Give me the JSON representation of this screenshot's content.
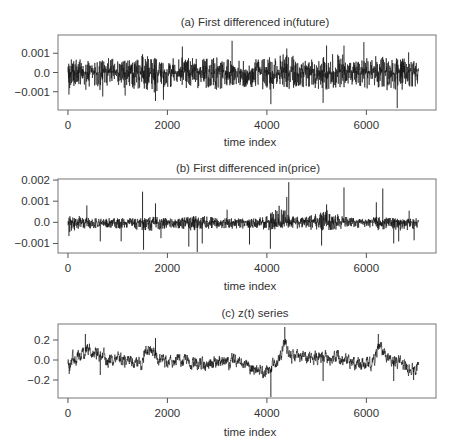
{
  "chart_data": [
    {
      "type": "line",
      "title": "(a) First differenced in(future)",
      "xlabel": "time index",
      "ylabel": "",
      "xlim": [
        -200,
        7400
      ],
      "ylim": [
        -0.00195,
        0.00195
      ],
      "xticks": [
        0,
        2000,
        4000,
        6000
      ],
      "xtick_labels": [
        "0",
        "2000",
        "4000",
        "6000"
      ],
      "yticks": [
        0.001,
        0.0,
        -0.001
      ],
      "ytick_labels": [
        "0.001",
        "0.0",
        "−0.001"
      ],
      "n_points": 7050,
      "grid": false,
      "legend": "none",
      "series": [
        {
          "name": "first-differenced ln(future)",
          "color": "#111111",
          "envelope_step": 250,
          "envelope_x": [
            0,
            250,
            500,
            750,
            1000,
            1250,
            1500,
            1750,
            2000,
            2250,
            2500,
            2750,
            3000,
            3250,
            3500,
            3750,
            4000,
            4250,
            4500,
            4750,
            5000,
            5250,
            5500,
            5750,
            6000,
            6250,
            6500,
            6750,
            7000
          ],
          "upper": [
            0.0007,
            0.0008,
            0.0006,
            0.0009,
            0.0006,
            0.0007,
            0.0009,
            0.0008,
            0.0007,
            0.0008,
            0.0009,
            0.0007,
            0.0008,
            0.0007,
            0.0006,
            0.0007,
            0.0008,
            0.001,
            0.0009,
            0.0006,
            0.0008,
            0.0011,
            0.001,
            0.0006,
            0.0008,
            0.0009,
            0.0008,
            0.0008,
            0.0007
          ],
          "lower": [
            -0.0009,
            -0.0007,
            -0.0008,
            -0.001,
            -0.0007,
            -0.0009,
            -0.0008,
            -0.0011,
            -0.0008,
            -0.0007,
            -0.0009,
            -0.0008,
            -0.0009,
            -0.0007,
            -0.0008,
            -0.0008,
            -0.001,
            -0.0008,
            -0.0009,
            -0.0008,
            -0.0009,
            -0.0009,
            -0.0008,
            -0.0007,
            -0.0009,
            -0.0008,
            -0.001,
            -0.0009,
            -0.0008
          ],
          "spikes": [
            {
              "x": 20,
              "y": -0.00115
            },
            {
              "x": 360,
              "y": -0.0009
            },
            {
              "x": 700,
              "y": -0.00125
            },
            {
              "x": 1150,
              "y": -0.0012
            },
            {
              "x": 1500,
              "y": 0.00095
            },
            {
              "x": 1760,
              "y": -0.00148
            },
            {
              "x": 1920,
              "y": -0.00142
            },
            {
              "x": 2300,
              "y": 0.00135
            },
            {
              "x": 3300,
              "y": 0.00165
            },
            {
              "x": 4080,
              "y": -0.00165
            },
            {
              "x": 4400,
              "y": 0.00125
            },
            {
              "x": 5130,
              "y": -0.00158
            },
            {
              "x": 5200,
              "y": 0.0014
            },
            {
              "x": 5550,
              "y": 0.0014
            },
            {
              "x": 5950,
              "y": 0.00158
            },
            {
              "x": 6620,
              "y": -0.00185
            },
            {
              "x": 6850,
              "y": 0.00105
            }
          ]
        }
      ]
    },
    {
      "type": "line",
      "title": "(b) First differenced in(price)",
      "xlabel": "time index",
      "ylabel": "",
      "xlim": [
        -200,
        7400
      ],
      "ylim": [
        -0.00145,
        0.00205
      ],
      "xticks": [
        0,
        2000,
        4000,
        6000
      ],
      "xtick_labels": [
        "0",
        "2000",
        "4000",
        "6000"
      ],
      "yticks": [
        0.002,
        0.001,
        0.0,
        -0.001
      ],
      "ytick_labels": [
        "0.002",
        "0.001",
        "0.0",
        "−0.001"
      ],
      "n_points": 7050,
      "grid": false,
      "legend": "none",
      "series": [
        {
          "name": "first-differenced ln(price)",
          "color": "#111111",
          "envelope_step": 250,
          "envelope_x": [
            0,
            250,
            500,
            750,
            1000,
            1250,
            1500,
            1750,
            2000,
            2250,
            2500,
            2750,
            3000,
            3250,
            3500,
            3750,
            4000,
            4250,
            4500,
            4750,
            5000,
            5250,
            5500,
            5750,
            6000,
            6250,
            6500,
            6750,
            7000
          ],
          "upper": [
            0.0003,
            0.0003,
            0.0002,
            0.0002,
            0.0002,
            0.0002,
            0.0002,
            0.0003,
            0.0002,
            0.0002,
            0.0003,
            0.0003,
            0.0002,
            0.0002,
            0.0002,
            0.0002,
            0.0003,
            0.0008,
            0.0003,
            0.0003,
            0.0004,
            0.0006,
            0.0003,
            0.0002,
            0.0002,
            0.0003,
            0.0002,
            0.0002,
            0.0002
          ],
          "lower": [
            -0.0005,
            -0.0003,
            -0.0003,
            -0.0003,
            -0.0003,
            -0.0003,
            -0.0004,
            -0.0004,
            -0.0003,
            -0.0003,
            -0.0004,
            -0.0003,
            -0.0003,
            -0.0003,
            -0.0003,
            -0.0003,
            -0.0004,
            -0.0003,
            -0.0003,
            -0.0003,
            -0.0004,
            -0.0004,
            -0.0003,
            -0.0003,
            -0.0003,
            -0.0004,
            -0.0004,
            -0.0004,
            -0.0003
          ],
          "spikes": [
            {
              "x": 20,
              "y": -0.00065
            },
            {
              "x": 380,
              "y": 0.0008
            },
            {
              "x": 650,
              "y": -0.0009
            },
            {
              "x": 1070,
              "y": -0.0009
            },
            {
              "x": 1500,
              "y": 0.00145
            },
            {
              "x": 1520,
              "y": -0.0013
            },
            {
              "x": 1760,
              "y": 0.0009
            },
            {
              "x": 1870,
              "y": -0.00075
            },
            {
              "x": 2430,
              "y": -0.00115
            },
            {
              "x": 2600,
              "y": -0.0014
            },
            {
              "x": 2700,
              "y": -0.001
            },
            {
              "x": 3200,
              "y": 0.0006
            },
            {
              "x": 3650,
              "y": -0.00105
            },
            {
              "x": 4070,
              "y": -0.00125
            },
            {
              "x": 4400,
              "y": 0.0012
            },
            {
              "x": 4440,
              "y": 0.0019
            },
            {
              "x": 5100,
              "y": -0.0011
            },
            {
              "x": 5200,
              "y": 0.00085
            },
            {
              "x": 5550,
              "y": 0.00165
            },
            {
              "x": 6200,
              "y": 0.00095
            },
            {
              "x": 6330,
              "y": 0.0016
            },
            {
              "x": 6550,
              "y": -0.001
            },
            {
              "x": 6650,
              "y": -0.0009
            },
            {
              "x": 6860,
              "y": 0.00055
            },
            {
              "x": 6960,
              "y": -0.00085
            }
          ]
        }
      ]
    },
    {
      "type": "line",
      "title": "(c) z(t) series",
      "xlabel": "time index",
      "ylabel": "",
      "xlim": [
        -200,
        7400
      ],
      "ylim": [
        -0.38,
        0.36
      ],
      "xticks": [
        0,
        2000,
        4000,
        6000
      ],
      "xtick_labels": [
        "0",
        "2000",
        "4000",
        "6000"
      ],
      "yticks": [
        0.2,
        0.0,
        -0.2
      ],
      "ytick_labels": [
        "0.2",
        "0.0",
        "−0.2"
      ],
      "n_points": 7050,
      "grid": false,
      "legend": "none",
      "series": [
        {
          "name": "z(t)",
          "color": "#111111",
          "level_x": [
            0,
            100,
            200,
            300,
            400,
            500,
            600,
            700,
            800,
            900,
            1000,
            1100,
            1200,
            1300,
            1400,
            1500,
            1550,
            1700,
            1800,
            2000,
            2200,
            2400,
            2600,
            2800,
            3000,
            3200,
            3400,
            3600,
            3800,
            3900,
            4000,
            4100,
            4200,
            4300,
            4350,
            4400,
            4500,
            4700,
            4900,
            5100,
            5300,
            5500,
            5700,
            5900,
            6100,
            6200,
            6250,
            6400,
            6600,
            6800,
            7000
          ],
          "level": [
            -0.05,
            0.02,
            0.03,
            0.07,
            0.11,
            0.09,
            0.08,
            0.04,
            0.0,
            -0.01,
            0.01,
            -0.02,
            0.0,
            -0.01,
            -0.02,
            -0.03,
            0.1,
            0.08,
            0.02,
            -0.01,
            0.0,
            -0.02,
            -0.05,
            -0.06,
            -0.03,
            -0.02,
            0.0,
            -0.06,
            -0.11,
            -0.12,
            -0.1,
            -0.08,
            0.0,
            0.08,
            0.2,
            0.12,
            0.04,
            0.03,
            0.03,
            0.04,
            0.03,
            0.02,
            -0.03,
            -0.05,
            -0.05,
            0.06,
            0.14,
            0.04,
            -0.02,
            -0.06,
            -0.08
          ],
          "noise_amplitude": 0.06,
          "spikes": [
            {
              "x": 25,
              "y": -0.14
            },
            {
              "x": 650,
              "y": -0.15
            },
            {
              "x": 350,
              "y": 0.26
            },
            {
              "x": 1760,
              "y": 0.22
            },
            {
              "x": 4080,
              "y": -0.37
            },
            {
              "x": 4360,
              "y": 0.33
            },
            {
              "x": 5130,
              "y": -0.21
            },
            {
              "x": 6240,
              "y": 0.26
            },
            {
              "x": 6550,
              "y": -0.21
            },
            {
              "x": 6950,
              "y": -0.2
            }
          ]
        }
      ]
    }
  ]
}
